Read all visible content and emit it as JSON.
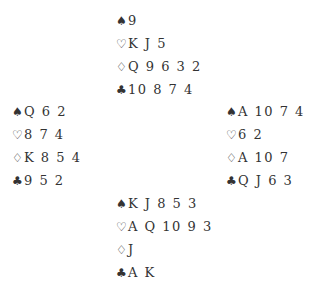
{
  "hands": {
    "north": {
      "spades": "9",
      "hearts": "K J 5",
      "diamonds": "Q 9 6 3 2",
      "clubs": "10 8 7 4"
    },
    "west": {
      "spades": "Q 6 2",
      "hearts": "8 7 4",
      "diamonds": "K 8 5 4",
      "clubs": "9 5 2"
    },
    "east": {
      "spades": "A 10 7 4",
      "hearts": "6 2",
      "diamonds": "A 10 7",
      "clubs": "Q J 6 3"
    },
    "south": {
      "spades": "K J 8 5 3",
      "hearts": "A Q 10 9 3",
      "diamonds": "J",
      "clubs": "A K"
    }
  },
  "symbols": {
    "spades": "♠",
    "hearts": "♡",
    "diamonds": "♢",
    "clubs": "♣"
  }
}
